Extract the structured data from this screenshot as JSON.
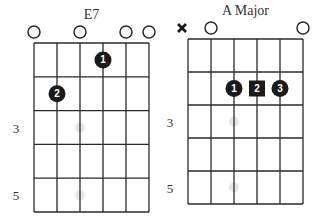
{
  "diagrams": [
    {
      "title": "E7",
      "grid": {
        "x0": 34,
        "y0": 43,
        "string_gap": 23,
        "fret_gap": 33.8,
        "strings": 6,
        "frets": 5
      },
      "fret_labels": [
        {
          "fret": 3,
          "label": "3"
        },
        {
          "fret": 5,
          "label": "5"
        }
      ],
      "open_strings": [
        1,
        3,
        5,
        6
      ],
      "muted_strings": [],
      "fingers": [
        {
          "string": 4,
          "fret": 1,
          "label": "1",
          "shape": "circle"
        },
        {
          "string": 2,
          "fret": 2,
          "label": "2",
          "shape": "circle"
        }
      ],
      "inlays": [
        3,
        5
      ]
    },
    {
      "title": "A Major",
      "grid": {
        "x0": 188,
        "y0": 39,
        "string_gap": 23,
        "fret_gap": 33,
        "strings": 6,
        "frets": 5
      },
      "fret_labels": [
        {
          "fret": 3,
          "label": "3"
        },
        {
          "fret": 5,
          "label": "5"
        }
      ],
      "open_strings": [
        2,
        6
      ],
      "muted_strings": [
        1
      ],
      "fingers": [
        {
          "string": 3,
          "fret": 2,
          "label": "1",
          "shape": "circle"
        },
        {
          "string": 4,
          "fret": 2,
          "label": "2",
          "shape": "square"
        },
        {
          "string": 5,
          "fret": 2,
          "label": "3",
          "shape": "circle"
        }
      ],
      "inlays": [
        3,
        5
      ]
    }
  ],
  "colors": {
    "line": "#2a2a2a",
    "finger": "#1a1a1a",
    "inlay": "#e6e6e6",
    "text": "#333333"
  }
}
